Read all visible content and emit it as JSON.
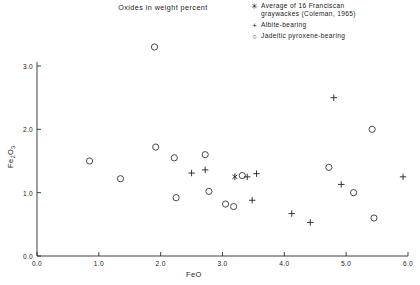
{
  "chart_data": {
    "type": "scatter",
    "title": "Oxides in weight percent",
    "xlabel": "FeO",
    "ylabel": "Fe2O3",
    "ylabel_display": "Fe₂O₃",
    "xlim": [
      0.0,
      6.0
    ],
    "ylim": [
      0.0,
      3.0
    ],
    "xticks": [
      "0.0",
      "1.0",
      "2.0",
      "3.0",
      "4.0",
      "5.0",
      "6.0"
    ],
    "xtick_values": [
      0.0,
      1.0,
      2.0,
      3.0,
      4.0,
      5.0,
      6.0
    ],
    "yticks": [
      "0.0",
      "1.0",
      "2.0",
      "3.0"
    ],
    "ytick_values": [
      0.0,
      1.0,
      2.0,
      3.0
    ],
    "grid": false,
    "legend_position": "top-right",
    "series": [
      {
        "name": "Average of 16 Franciscan graywackes (Coleman, 1965)",
        "marker": "asterisk",
        "points": [
          [
            3.2,
            1.25
          ]
        ]
      },
      {
        "name": "Albite-bearing",
        "marker": "plus",
        "points": [
          [
            2.5,
            1.31
          ],
          [
            2.72,
            1.36
          ],
          [
            3.4,
            1.25
          ],
          [
            3.55,
            1.3
          ],
          [
            3.48,
            0.88
          ],
          [
            4.12,
            0.67
          ],
          [
            4.42,
            0.53
          ],
          [
            4.8,
            2.5
          ],
          [
            4.92,
            1.13
          ],
          [
            5.92,
            1.25
          ]
        ]
      },
      {
        "name": "Jadeitic pyroxene-bearing",
        "marker": "circle",
        "points": [
          [
            1.9,
            3.3
          ],
          [
            0.85,
            1.5
          ],
          [
            1.35,
            1.22
          ],
          [
            1.92,
            1.72
          ],
          [
            2.22,
            1.55
          ],
          [
            2.25,
            0.92
          ],
          [
            2.72,
            1.6
          ],
          [
            2.78,
            1.02
          ],
          [
            3.05,
            0.82
          ],
          [
            3.18,
            0.78
          ],
          [
            3.32,
            1.27
          ],
          [
            4.72,
            1.4
          ],
          [
            5.12,
            1.0
          ],
          [
            5.42,
            2.0
          ],
          [
            5.45,
            0.6
          ]
        ]
      }
    ]
  },
  "legend": {
    "entries": [
      {
        "marker_glyph": "✳",
        "marker_name": "asterisk-marker",
        "line1": "Average of 16 Franciscan",
        "line2": "graywackes  (Coleman, 1965)"
      },
      {
        "marker_glyph": "+",
        "marker_name": "plus-marker",
        "line1": "Albite-bearing",
        "line2": ""
      },
      {
        "marker_glyph": "○",
        "marker_name": "circle-marker",
        "line1": "Jadeitic pyroxene-bearing",
        "line2": ""
      }
    ]
  }
}
